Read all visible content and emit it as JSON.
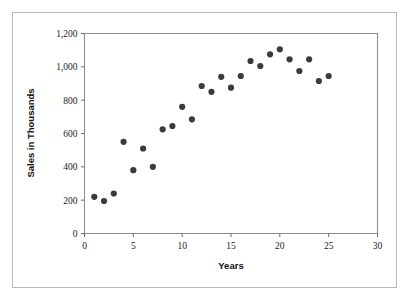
{
  "chart_data": {
    "type": "scatter",
    "title": "",
    "xlabel": "Years",
    "ylabel": "Sales in Thousands",
    "xlim": [
      0,
      30
    ],
    "ylim": [
      0,
      1200
    ],
    "xticks": [
      0,
      5,
      10,
      15,
      20,
      25,
      30
    ],
    "xtick_labels": [
      "0",
      "5",
      "10",
      "15",
      "20",
      "25",
      "30"
    ],
    "yticks": [
      0,
      200,
      400,
      600,
      800,
      1000,
      1200
    ],
    "ytick_labels": [
      "0",
      "200",
      "400",
      "600",
      "800",
      "1,000",
      "1,200"
    ],
    "grid": false,
    "legend": null,
    "marker_color": "#3b3b3b",
    "marker_shape": "circle",
    "x": [
      1,
      2,
      3,
      4,
      5,
      6,
      7,
      8,
      9,
      10,
      11,
      12,
      13,
      14,
      15,
      16,
      17,
      18,
      19,
      20,
      21,
      22,
      23,
      24,
      25
    ],
    "y": [
      220,
      195,
      240,
      550,
      380,
      510,
      400,
      625,
      645,
      760,
      685,
      885,
      850,
      940,
      875,
      945,
      1035,
      1005,
      1075,
      1105,
      1045,
      975,
      1045,
      915,
      945
    ],
    "points": [
      {
        "x": 1,
        "y": 220
      },
      {
        "x": 2,
        "y": 195
      },
      {
        "x": 3,
        "y": 240
      },
      {
        "x": 4,
        "y": 550
      },
      {
        "x": 5,
        "y": 380
      },
      {
        "x": 6,
        "y": 510
      },
      {
        "x": 7,
        "y": 400
      },
      {
        "x": 8,
        "y": 625
      },
      {
        "x": 9,
        "y": 645
      },
      {
        "x": 10,
        "y": 760
      },
      {
        "x": 11,
        "y": 685
      },
      {
        "x": 12,
        "y": 885
      },
      {
        "x": 13,
        "y": 850
      },
      {
        "x": 14,
        "y": 940
      },
      {
        "x": 15,
        "y": 875
      },
      {
        "x": 16,
        "y": 945
      },
      {
        "x": 17,
        "y": 1035
      },
      {
        "x": 18,
        "y": 1005
      },
      {
        "x": 19,
        "y": 1075
      },
      {
        "x": 20,
        "y": 1105
      },
      {
        "x": 21,
        "y": 1045
      },
      {
        "x": 22,
        "y": 975
      },
      {
        "x": 23,
        "y": 1045
      },
      {
        "x": 24,
        "y": 915
      },
      {
        "x": 25,
        "y": 945
      }
    ]
  }
}
